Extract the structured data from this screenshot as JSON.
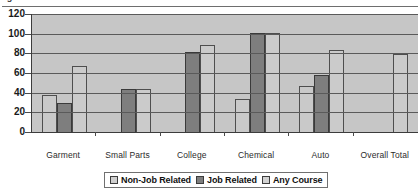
{
  "top_caption": "ig",
  "axis": {
    "y_ticks": [
      "120",
      "100",
      "80",
      "60",
      "40",
      "20",
      "0"
    ]
  },
  "legend": {
    "items": [
      {
        "label": "Non-Job Related",
        "swatch": "light-gray-swatch-icon",
        "color": "#cfcfcf"
      },
      {
        "label": "Job Related",
        "swatch": "dark-gray-swatch-icon",
        "color": "#7e7e7e"
      },
      {
        "label": "Any Course",
        "swatch": "light-gray-swatch-icon",
        "color": "#d2d2d2"
      }
    ]
  },
  "chart_data": {
    "type": "bar",
    "title": "",
    "xlabel": "",
    "ylabel": "",
    "ylim": [
      0,
      120
    ],
    "ytick_step": 20,
    "grid": true,
    "legend_position": "bottom",
    "categories": [
      "Garment",
      "Small Parts",
      "College",
      "Chemical",
      "Auto",
      "Overall Total"
    ],
    "series": [
      {
        "name": "Non-Job Related",
        "values": [
          38,
          0,
          0,
          34,
          47,
          0
        ]
      },
      {
        "name": "Job Related",
        "values": [
          30,
          44,
          81,
          101,
          58,
          0
        ]
      },
      {
        "name": "Any Course",
        "values": [
          67,
          44,
          88,
          101,
          83,
          79
        ]
      }
    ]
  }
}
